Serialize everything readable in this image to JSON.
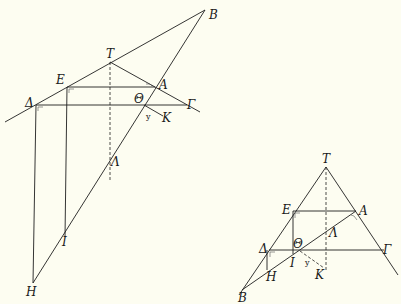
{
  "background": "#fdfdf1",
  "line_color": "#1e1e1e",
  "figures": [
    {
      "id": "left",
      "labels": {
        "B": "B",
        "T": "T",
        "E": "E",
        "A": "A",
        "Delta": "Δ",
        "Theta": "Θ",
        "Gamma": "Γ",
        "K": "K",
        "y": "y",
        "Lambda": "Λ",
        "I": "I",
        "H": "H"
      }
    },
    {
      "id": "right",
      "labels": {
        "T": "T",
        "E": "E",
        "A": "A",
        "Lambda": "Λ",
        "Delta": "Δ",
        "Theta": "Θ",
        "Gamma": "Γ",
        "I": "I",
        "y": "y",
        "K": "K",
        "H": "H",
        "B": "B"
      }
    }
  ]
}
